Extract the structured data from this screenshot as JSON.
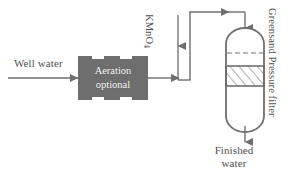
{
  "diagram": {
    "colors": {
      "line": "#6f6f6f",
      "equipment_fill": "#6e6e6e",
      "equipment_text": "#ffffff",
      "label_text": "#4f4f4f",
      "background": "#ffffff",
      "hatch": "#6f6f6f"
    },
    "labels": {
      "well_water": "Well water",
      "aeration_line1": "Aeration",
      "aeration_line2": "optional",
      "kmno4_main": "KMnO",
      "kmno4_sub": "4",
      "finished_water_line1": "Finished",
      "finished_water_line2": "water",
      "greensand_filter": "Greensand Pressure filter"
    },
    "nodes": [
      {
        "id": "well-water-inlet",
        "type": "stream",
        "label": "Well water"
      },
      {
        "id": "aeration-unit",
        "type": "equipment",
        "label": "Aeration optional"
      },
      {
        "id": "kmno4-dosing",
        "type": "chemical-feed",
        "label": "KMnO4"
      },
      {
        "id": "greensand-pressure-filter",
        "type": "vessel",
        "label": "Greensand Pressure filter"
      },
      {
        "id": "finished-water-outlet",
        "type": "stream",
        "label": "Finished water"
      }
    ],
    "flow_sequence": [
      "Well water",
      "Aeration optional",
      "KMnO4",
      "Greensand Pressure filter",
      "Finished water"
    ]
  }
}
